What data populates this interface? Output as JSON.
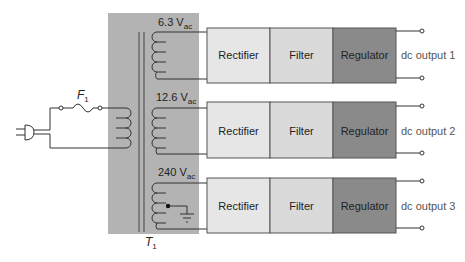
{
  "diagram": {
    "type": "power-supply-block-diagram",
    "transformer": {
      "label": "T",
      "label_sub": "1",
      "panel_color": "#b3b3b3"
    },
    "fuse": {
      "label": "F",
      "label_sub": "1"
    },
    "input": {
      "icon": "ac-plug-icon"
    },
    "secondaries": [
      {
        "voltage": "6.3 V",
        "voltage_sub": "ac",
        "center_tap_ground": false
      },
      {
        "voltage": "12.6 V",
        "voltage_sub": "ac",
        "center_tap_ground": false
      },
      {
        "voltage": "240 V",
        "voltage_sub": "ac",
        "center_tap_ground": true
      }
    ],
    "rows": [
      {
        "blocks": [
          {
            "label": "Rectifier",
            "color": "#e6e6e6"
          },
          {
            "label": "Filter",
            "color": "#dadada"
          },
          {
            "label": "Regulator",
            "color": "#8a8a8a"
          }
        ],
        "output_label": "dc output 1"
      },
      {
        "blocks": [
          {
            "label": "Rectifier",
            "color": "#e6e6e6"
          },
          {
            "label": "Filter",
            "color": "#dadada"
          },
          {
            "label": "Regulator",
            "color": "#8a8a8a"
          }
        ],
        "output_label": "dc output 2"
      },
      {
        "blocks": [
          {
            "label": "Rectifier",
            "color": "#e6e6e6"
          },
          {
            "label": "Filter",
            "color": "#dadada"
          },
          {
            "label": "Regulator",
            "color": "#8a8a8a"
          }
        ],
        "output_label": "dc output 3"
      }
    ]
  }
}
